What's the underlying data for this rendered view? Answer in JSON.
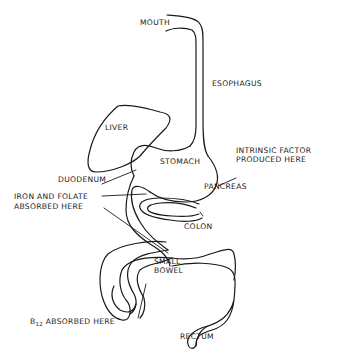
{
  "diagram": {
    "type": "anatomical-sketch",
    "stroke_color": "#1a1a1a",
    "background": "#ffffff",
    "labels": {
      "mouth": "MOUTH",
      "esophagus": "ESOPHAGUS",
      "liver": "LIVER",
      "stomach": "STOMACH",
      "intrinsic_factor_line1": "INTRINSIC FACTOR",
      "intrinsic_factor_line2": "PRODUCED HERE",
      "duodenum": "DUODENUM",
      "pancreas": "PANCREAS",
      "iron_folate_line1": "IRON AND FOLATE",
      "iron_folate_line2": "ABSORBED HERE",
      "colon": "COLON",
      "small_bowel_line1": "SMALL",
      "small_bowel_line2": "BOWEL",
      "b12_prefix": "B",
      "b12_subscript": "12",
      "b12_rest": " ABSORBED HERE",
      "rectum": "RECTUM"
    }
  }
}
